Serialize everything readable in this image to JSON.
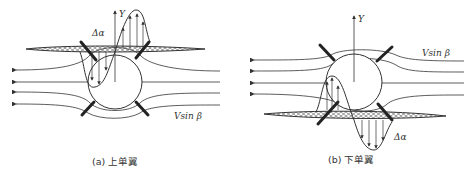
{
  "figure": {
    "panels": [
      {
        "id": "a",
        "caption": "(a) 上单翼",
        "axis_label": "Y",
        "delta_label": "Δα",
        "flow_label": "Vsin β",
        "wing_position": "high"
      },
      {
        "id": "b",
        "caption": "(b) 下单翼",
        "axis_label": "Y",
        "delta_label": "Δα",
        "flow_label": "Vsin β",
        "wing_position": "low"
      }
    ],
    "colors": {
      "line": "#333333",
      "background": "#ffffff",
      "hatch": "#555555"
    }
  }
}
